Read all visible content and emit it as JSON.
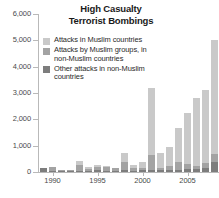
{
  "chart_data": {
    "type": "bar",
    "barmode": "stacked",
    "title": "High Casualty Terrorist Bombings",
    "title_line1": "High Casualty",
    "title_line2": "Terrorist Bombings",
    "xlabel": "",
    "ylabel": "",
    "ylim": [
      0,
      6000
    ],
    "ytick_values": [
      0,
      1000,
      2000,
      3000,
      4000,
      5000,
      6000
    ],
    "ytick_labels": [
      "0",
      "1,000",
      "2,000",
      "3,000",
      "4,000",
      "5,000",
      "6,000"
    ],
    "grid": false,
    "legend_position": "inside-top-left",
    "categories": [
      1989,
      1990,
      1991,
      1992,
      1993,
      1994,
      1995,
      1996,
      1997,
      1998,
      1999,
      2000,
      2001,
      2002,
      2003,
      2004,
      2005,
      2006,
      2007,
      2008
    ],
    "xtick_labels": [
      "1990",
      "1995",
      "2000",
      "2005"
    ],
    "xtick_years": [
      1990,
      1995,
      2000,
      2005
    ],
    "series": [
      {
        "name": "Attacks in Muslim countries",
        "color": "#c9c9c9",
        "values": [
          0,
          0,
          0,
          0,
          150,
          60,
          90,
          60,
          30,
          330,
          130,
          200,
          2550,
          560,
          740,
          1320,
          1960,
          2560,
          2770,
          4300
        ]
      },
      {
        "name": "Attacks by Muslim groups, in non-Muslim countries",
        "color": "#a3a3a3",
        "values": [
          0,
          140,
          20,
          40,
          220,
          90,
          130,
          130,
          100,
          330,
          100,
          110,
          580,
          100,
          160,
          300,
          170,
          130,
          170,
          330
        ]
      },
      {
        "name": "Other attacks in non-Muslim countries",
        "color": "#7d7d7d",
        "values": [
          140,
          40,
          30,
          50,
          50,
          40,
          60,
          50,
          40,
          60,
          40,
          60,
          70,
          60,
          60,
          70,
          130,
          110,
          160,
          370
        ]
      }
    ],
    "totals": [
      140,
      180,
      50,
      90,
      420,
      190,
      280,
      240,
      170,
      720,
      270,
      370,
      3200,
      720,
      960,
      1690,
      2260,
      2800,
      3100,
      5000
    ]
  },
  "legend": {
    "items": [
      {
        "label": "Attacks in Muslim countries",
        "swatch_color": "#c9c9c9",
        "swatch_name": "legend-swatch-muslim-countries"
      },
      {
        "label": "Attacks by Muslim groups, in non-Muslim countries",
        "swatch_color": "#a3a3a3",
        "swatch_name": "legend-swatch-muslim-groups-nonmuslim"
      },
      {
        "label": "Other attacks in non-Muslim countries",
        "swatch_color": "#7d7d7d",
        "swatch_name": "legend-swatch-other-nonmuslim"
      }
    ]
  },
  "colors": {
    "axis": "#b9b9b9",
    "axis_text": "#4a4a4a",
    "title_text": "#1a1a1a",
    "legend_text": "#2b2b2b",
    "background": "#ffffff"
  }
}
